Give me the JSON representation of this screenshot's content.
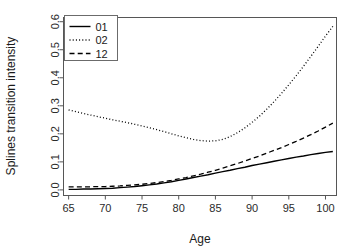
{
  "chart_data": {
    "type": "line",
    "title": "",
    "xlabel": "Age",
    "ylabel": "Splines transition intensity",
    "xlim": [
      64.3,
      101.5
    ],
    "ylim": [
      -0.02,
      0.615
    ],
    "xticks": [
      65,
      70,
      75,
      80,
      85,
      90,
      95,
      100
    ],
    "xticklabels": [
      "65",
      "70",
      "75",
      "80",
      "85",
      "90",
      "95",
      "100"
    ],
    "yticks": [
      0.0,
      0.1,
      0.2,
      0.3,
      0.4,
      0.5,
      0.6
    ],
    "yticklabels": [
      "0.0",
      "0.1",
      "0.2",
      "0.3",
      "0.4",
      "0.5",
      "0.6"
    ],
    "grid": false,
    "legend_position": "top-left",
    "legend_entries": [
      "01",
      "02",
      "12"
    ],
    "x": [
      65,
      66,
      67,
      68,
      69,
      70,
      71,
      72,
      73,
      74,
      75,
      76,
      77,
      78,
      79,
      80,
      81,
      82,
      83,
      84,
      85,
      86,
      87,
      88,
      89,
      90,
      91,
      92,
      93,
      94,
      95,
      96,
      97,
      98,
      99,
      100,
      101
    ],
    "series": [
      {
        "name": "01",
        "style": "solid",
        "color": "#000000",
        "values": [
          0.002,
          0.002,
          0.003,
          0.003,
          0.004,
          0.005,
          0.006,
          0.008,
          0.01,
          0.012,
          0.015,
          0.018,
          0.021,
          0.025,
          0.029,
          0.034,
          0.039,
          0.044,
          0.049,
          0.054,
          0.06,
          0.065,
          0.07,
          0.076,
          0.081,
          0.087,
          0.092,
          0.097,
          0.102,
          0.107,
          0.112,
          0.117,
          0.121,
          0.126,
          0.13,
          0.134,
          0.137
        ]
      },
      {
        "name": "02",
        "style": "dotted",
        "color": "#000000",
        "values": [
          0.285,
          0.279,
          0.273,
          0.267,
          0.261,
          0.256,
          0.25,
          0.245,
          0.24,
          0.234,
          0.228,
          0.222,
          0.215,
          0.208,
          0.2,
          0.193,
          0.186,
          0.18,
          0.176,
          0.174,
          0.175,
          0.18,
          0.19,
          0.204,
          0.221,
          0.241,
          0.263,
          0.288,
          0.315,
          0.344,
          0.375,
          0.407,
          0.441,
          0.476,
          0.512,
          0.549,
          0.583
        ]
      },
      {
        "name": "12",
        "style": "dashed",
        "color": "#000000",
        "values": [
          0.011,
          0.011,
          0.011,
          0.011,
          0.012,
          0.012,
          0.013,
          0.014,
          0.016,
          0.018,
          0.02,
          0.023,
          0.026,
          0.03,
          0.034,
          0.039,
          0.044,
          0.05,
          0.056,
          0.063,
          0.07,
          0.078,
          0.086,
          0.094,
          0.103,
          0.112,
          0.121,
          0.131,
          0.141,
          0.151,
          0.162,
          0.173,
          0.185,
          0.197,
          0.21,
          0.224,
          0.238
        ]
      }
    ]
  }
}
